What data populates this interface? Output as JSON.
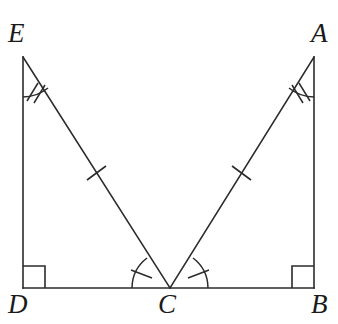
{
  "figure": {
    "type": "geometry-diagram",
    "stroke_color": "#2b2b2b",
    "background_color": "#ffffff",
    "label_color": "#1a1a1a"
  },
  "vertices": [
    {
      "id": "E",
      "label": "E",
      "x": 23,
      "y": 57,
      "label_x": 8,
      "label_y": 20
    },
    {
      "id": "A",
      "label": "A",
      "x": 314,
      "y": 57,
      "label_x": 311,
      "label_y": 20
    },
    {
      "id": "D",
      "label": "D",
      "x": 23,
      "y": 288,
      "label_x": 8,
      "label_y": 291
    },
    {
      "id": "C",
      "label": "C",
      "x": 170,
      "y": 288,
      "label_x": 158,
      "label_y": 291
    },
    {
      "id": "B",
      "label": "B",
      "x": 314,
      "y": 288,
      "label_x": 311,
      "label_y": 291
    }
  ],
  "segments": [
    {
      "name": "segment-ED",
      "from": "E",
      "to": "D",
      "x1": 23,
      "y1": 57,
      "x2": 23,
      "y2": 288,
      "ticks": 0
    },
    {
      "name": "segment-AB",
      "from": "A",
      "to": "B",
      "x1": 314,
      "y1": 57,
      "x2": 314,
      "y2": 288,
      "ticks": 0
    },
    {
      "name": "segment-DB",
      "from": "D",
      "to": "B",
      "x1": 23,
      "y1": 288,
      "x2": 314,
      "y2": 288,
      "ticks": 0
    },
    {
      "name": "segment-EC",
      "from": "E",
      "to": "C",
      "x1": 23,
      "y1": 57,
      "x2": 170,
      "y2": 288,
      "ticks": 1
    },
    {
      "name": "segment-AC",
      "from": "A",
      "to": "C",
      "x1": 314,
      "y1": 57,
      "x2": 170,
      "y2": 288,
      "ticks": 1
    }
  ],
  "angle_marks": [
    {
      "name": "angle-E",
      "vertex": "E",
      "ticks": 2,
      "kind": "arc"
    },
    {
      "name": "angle-A",
      "vertex": "A",
      "ticks": 2,
      "kind": "arc"
    },
    {
      "name": "angle-DCE",
      "vertex": "C",
      "ticks": 1,
      "kind": "arc"
    },
    {
      "name": "angle-BCA",
      "vertex": "C",
      "ticks": 1,
      "kind": "arc"
    }
  ],
  "right_angles": [
    {
      "name": "right-angle-D",
      "vertex": "D",
      "size": 22
    },
    {
      "name": "right-angle-B",
      "vertex": "B",
      "size": 22
    }
  ]
}
